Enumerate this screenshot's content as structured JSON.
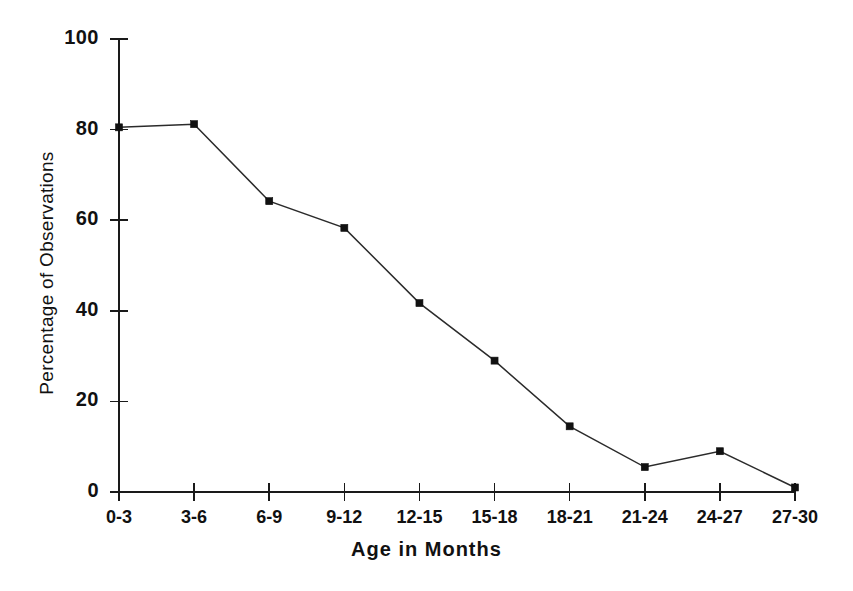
{
  "chart_data": {
    "type": "line",
    "title": "",
    "subtitle": "",
    "xlabel": "Age in Months",
    "ylabel": "Percentage of Observations",
    "categories": [
      "0-3",
      "3-6",
      "6-9",
      "9-12",
      "12-15",
      "15-18",
      "18-21",
      "21-24",
      "24-27",
      "27-30"
    ],
    "values": [
      80.5,
      81.2,
      64.2,
      58.3,
      41.7,
      29.0,
      14.5,
      5.5,
      9.0,
      1.0
    ],
    "series": [
      {
        "name": "Percentage of Observations",
        "values": [
          80.5,
          81.2,
          64.2,
          58.3,
          41.7,
          29.0,
          14.5,
          5.5,
          9.0,
          1.0
        ]
      }
    ],
    "ylim": [
      0,
      100
    ],
    "yticks": [
      0,
      20,
      40,
      60,
      80,
      100
    ],
    "ytick_labels": [
      "0",
      "20",
      "40",
      "60",
      "80",
      "100"
    ],
    "grid": false,
    "legend": false,
    "legend_position": "none",
    "marker": "square",
    "line_color": "#2b2b2b",
    "marker_color": "#111111",
    "background_color": "#ffffff",
    "annotations": []
  }
}
